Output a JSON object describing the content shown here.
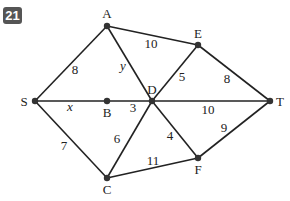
{
  "problem_number": "21",
  "colors": {
    "line": "#222222",
    "node": "#333333",
    "badge": "#555555"
  },
  "nodes": [
    {
      "id": "A",
      "label": "A",
      "x": 107,
      "y": 26,
      "lx": 107,
      "ly": 18
    },
    {
      "id": "E",
      "label": "E",
      "x": 198,
      "y": 45,
      "lx": 198,
      "ly": 38
    },
    {
      "id": "S",
      "label": "S",
      "x": 35,
      "y": 101,
      "lx": 24,
      "ly": 106
    },
    {
      "id": "B",
      "label": "B",
      "x": 107,
      "y": 101,
      "lx": 107,
      "ly": 117
    },
    {
      "id": "D",
      "label": "D",
      "x": 152,
      "y": 101,
      "lx": 152,
      "ly": 94
    },
    {
      "id": "T",
      "label": "T",
      "x": 270,
      "y": 101,
      "lx": 280,
      "ly": 106
    },
    {
      "id": "C",
      "label": "C",
      "x": 107,
      "y": 178,
      "lx": 107,
      "ly": 194
    },
    {
      "id": "F",
      "label": "F",
      "x": 198,
      "y": 158,
      "lx": 198,
      "ly": 174
    }
  ],
  "edges": [
    {
      "from": "S",
      "to": "A",
      "weight": "8",
      "lx": 75,
      "ly": 74,
      "italic": false
    },
    {
      "from": "A",
      "to": "E",
      "weight": "10",
      "lx": 151,
      "ly": 48,
      "italic": false
    },
    {
      "from": "A",
      "to": "D",
      "weight": "y",
      "lx": 123,
      "ly": 70,
      "italic": true
    },
    {
      "from": "E",
      "to": "D",
      "weight": "5",
      "lx": 182,
      "ly": 81,
      "italic": false
    },
    {
      "from": "E",
      "to": "T",
      "weight": "8",
      "lx": 227,
      "ly": 83,
      "italic": false
    },
    {
      "from": "S",
      "to": "B",
      "weight": "x",
      "lx": 70,
      "ly": 111,
      "italic": true
    },
    {
      "from": "B",
      "to": "D",
      "weight": "3",
      "lx": 133,
      "ly": 112,
      "italic": false
    },
    {
      "from": "D",
      "to": "T",
      "weight": "10",
      "lx": 208,
      "ly": 114,
      "italic": false
    },
    {
      "from": "S",
      "to": "C",
      "weight": "7",
      "lx": 64,
      "ly": 150,
      "italic": false
    },
    {
      "from": "C",
      "to": "D",
      "weight": "6",
      "lx": 117,
      "ly": 143,
      "italic": false
    },
    {
      "from": "D",
      "to": "F",
      "weight": "4",
      "lx": 170,
      "ly": 140,
      "italic": false
    },
    {
      "from": "T",
      "to": "F",
      "weight": "9",
      "lx": 224,
      "ly": 132,
      "italic": false
    },
    {
      "from": "C",
      "to": "F",
      "weight": "11",
      "lx": 153,
      "ly": 165,
      "italic": false
    }
  ]
}
